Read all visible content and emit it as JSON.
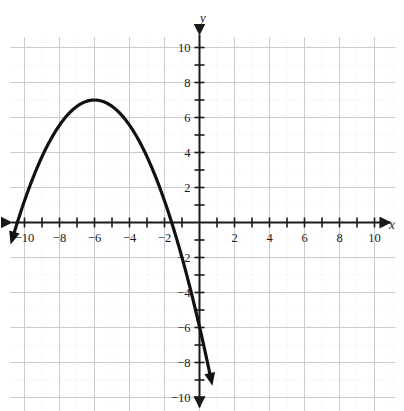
{
  "figure": {
    "kind": "coordinate-plane-graph",
    "background_color": "#ffffff",
    "curve_color": "#111111",
    "axis_color": "#1a1a1a",
    "major_grid_color": "#c9ccd1",
    "minor_grid_color": "#e6e8ea",
    "label_color": "#1a1a1a"
  },
  "axis_labels": {
    "x": "x",
    "y": "y"
  },
  "chart_data": {
    "type": "line",
    "title": "",
    "subtitle": "",
    "xlabel": "x",
    "ylabel": "y",
    "xlim": [
      -11,
      11
    ],
    "ylim": [
      -11,
      11
    ],
    "grid": true,
    "major_grid_step": 2,
    "minor_grid_step": 1,
    "tick_step": 1,
    "legend": "none",
    "x_tick_labels": [
      "-10",
      "-8",
      "-6",
      "-4",
      "-2",
      "2",
      "4",
      "6",
      "8",
      "10"
    ],
    "x_tick_values": [
      -10,
      -8,
      -6,
      -4,
      -2,
      2,
      4,
      6,
      8,
      10
    ],
    "y_tick_labels": [
      "10",
      "8",
      "6",
      "4",
      "2",
      "-2",
      "-4",
      "-6",
      "-8",
      "-10"
    ],
    "y_tick_values": [
      10,
      8,
      6,
      4,
      2,
      -2,
      -4,
      -6,
      -8,
      -10
    ],
    "series": [
      {
        "name": "parabola",
        "shape": "downward parabola",
        "equation": "y = -0.36(x + 6)^2 + 7",
        "vertex": [
          -6,
          7
        ],
        "leading_coefficient": -0.36,
        "y_intercept": -6,
        "x_intercepts": [
          -10.4,
          -1.6
        ],
        "domain_drawn": [
          -10.6,
          0.6
        ],
        "arrow_start": true,
        "arrow_end": true,
        "x": [
          -10.6,
          -10.0,
          -9.5,
          -9.0,
          -8.5,
          -8.0,
          -7.5,
          -7.0,
          -6.5,
          -6.0,
          -5.5,
          -5.0,
          -4.5,
          -4.0,
          -3.5,
          -3.0,
          -2.5,
          -2.0,
          -1.5,
          -1.0,
          -0.5,
          0.0,
          0.3,
          0.6
        ],
        "y": [
          0.4,
          1.2,
          2.5,
          3.8,
          4.8,
          5.6,
          6.2,
          6.6,
          6.9,
          7.0,
          6.9,
          6.6,
          6.2,
          5.6,
          4.8,
          3.8,
          2.6,
          1.2,
          -0.4,
          -2.2,
          -4.1,
          -6.0,
          -7.2,
          -8.4
        ]
      }
    ]
  }
}
